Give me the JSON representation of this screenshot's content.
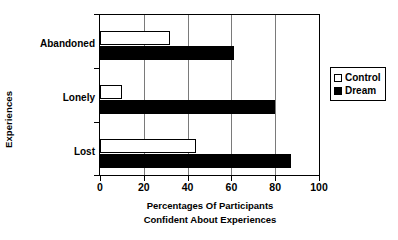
{
  "chart_data": {
    "type": "bar",
    "orientation": "horizontal",
    "title": "",
    "xlabel": "Percentages Of Participants Confident About Experiences",
    "xlabel_lines": [
      "Percentages Of Participants",
      "Confident About Experiences"
    ],
    "ylabel": "Experiences",
    "categories": [
      "Abandoned",
      "Lonely",
      "Lost"
    ],
    "series": [
      {
        "name": "Control",
        "values": [
          32,
          10,
          44
        ],
        "color": "#ffffff",
        "edge_color": "#000000"
      },
      {
        "name": "Dream",
        "values": [
          61,
          80,
          87
        ],
        "color": "#000000",
        "edge_color": "#000000"
      }
    ],
    "xlim": [
      0,
      100
    ],
    "xticks": [
      0,
      20,
      40,
      60,
      80,
      100
    ],
    "xtick_labels": [
      "0",
      "20",
      "40",
      "60",
      "80",
      "100"
    ],
    "gridlines": {
      "vertical_at": [
        20,
        40,
        60,
        80
      ],
      "horizontal": false,
      "color": "#7a7a7a"
    },
    "legend": {
      "position": "right-outside",
      "entries": [
        {
          "label": "Control",
          "swatch": "hollow-square"
        },
        {
          "label": "Dream",
          "swatch": "filled-square"
        }
      ]
    },
    "axes_frame": true,
    "background_color": "#ffffff",
    "text_color": "#000000"
  }
}
